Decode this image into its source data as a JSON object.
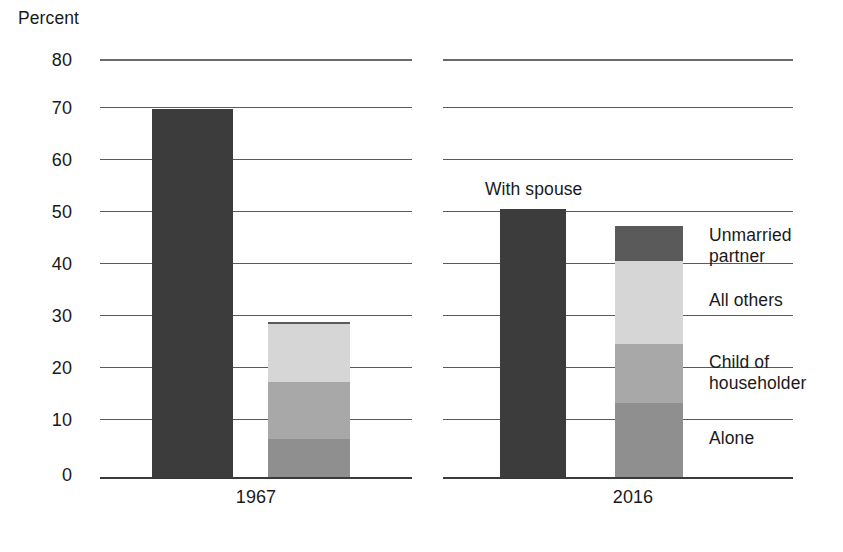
{
  "chart_data": {
    "type": "bar",
    "title": "",
    "subtitle": "",
    "xlabel": "",
    "ylabel": "Percent",
    "ylim": [
      0,
      80
    ],
    "ytick_labels": [
      "80",
      "70",
      "60",
      "50",
      "40",
      "30",
      "20",
      "10",
      "0"
    ],
    "ytick_values": [
      80,
      70,
      60,
      50,
      40,
      30,
      20,
      10,
      0
    ],
    "grid": true,
    "legend_position": "right",
    "categories": [
      "1967",
      "2016"
    ],
    "annotations": [
      {
        "text": "With spouse",
        "refers_to": "With spouse bar, 2016 panel"
      }
    ],
    "bars": [
      {
        "group": "1967",
        "name": "with-spouse",
        "stacked": false,
        "segments": [
          {
            "label": "With spouse",
            "value": 70.4,
            "color": "#3c3c3c"
          }
        ],
        "total": 70.4
      },
      {
        "group": "1967",
        "name": "living-arrangements",
        "stacked": true,
        "segments": [
          {
            "label": "Alone",
            "value": 7.3,
            "color": "#8f8f8f"
          },
          {
            "label": "Child of householder",
            "value": 10.9,
            "color": "#a8a8a8"
          },
          {
            "label": "All others",
            "value": 11.0,
            "color": "#d6d6d6"
          },
          {
            "label": "Unmarried partner",
            "value": 0.5,
            "color": "#5a5a5a"
          }
        ],
        "total": 29.7
      },
      {
        "group": "2016",
        "name": "with-spouse",
        "stacked": false,
        "segments": [
          {
            "label": "With spouse",
            "value": 51.3,
            "color": "#3c3c3c"
          }
        ],
        "total": 51.3
      },
      {
        "group": "2016",
        "name": "living-arrangements",
        "stacked": true,
        "segments": [
          {
            "label": "Alone",
            "value": 14.2,
            "color": "#8f8f8f"
          },
          {
            "label": "Child of householder",
            "value": 11.3,
            "color": "#a8a8a8"
          },
          {
            "label": "All others",
            "value": 15.9,
            "color": "#d6d6d6"
          },
          {
            "label": "Unmarried partner",
            "value": 6.6,
            "color": "#5a5a5a"
          }
        ],
        "total": 48.0
      }
    ],
    "legend": [
      {
        "label_line1": "Unmarried",
        "label_line2": "partner",
        "color": "#5a5a5a"
      },
      {
        "label_line1": "All others",
        "label_line2": "",
        "color": "#d6d6d6"
      },
      {
        "label_line1": "Child of",
        "label_line2": "householder",
        "color": "#a8a8a8"
      },
      {
        "label_line1": "Alone",
        "label_line2": "",
        "color": "#8f8f8f"
      }
    ],
    "colors": {
      "with_spouse": "#3c3c3c",
      "unmarried_partner": "#5a5a5a",
      "all_others": "#d6d6d6",
      "child_of_householder": "#a8a8a8",
      "alone": "#8f8f8f",
      "gridline": "#5a5a5a",
      "baseline": "#3a3a3a",
      "text": "#1a1a1a",
      "background": "#ffffff"
    }
  },
  "axis": {
    "y_title": "Percent",
    "ticks": [
      {
        "label": "80"
      },
      {
        "label": "70"
      },
      {
        "label": "60"
      },
      {
        "label": "50"
      },
      {
        "label": "40"
      },
      {
        "label": "30"
      },
      {
        "label": "20"
      },
      {
        "label": "10"
      },
      {
        "label": "0"
      }
    ]
  },
  "panels": [
    {
      "xtick": "1967"
    },
    {
      "xtick": "2016"
    }
  ],
  "annotation": {
    "with_spouse": "With spouse"
  },
  "legend": [
    {
      "line1": "Unmarried",
      "line2": "partner"
    },
    {
      "line1": "All others",
      "line2": ""
    },
    {
      "line1": "Child of",
      "line2": "householder"
    },
    {
      "line1": "Alone",
      "line2": ""
    }
  ]
}
